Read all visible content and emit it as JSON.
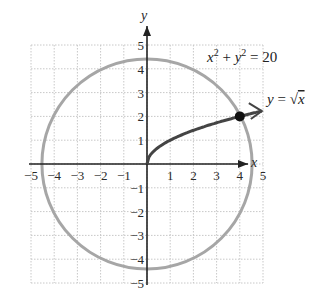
{
  "chart_data": {
    "type": "line",
    "title": "",
    "xlabel": "x",
    "ylabel": "y",
    "xlim": [
      -5,
      5
    ],
    "ylim": [
      -5,
      5
    ],
    "grid": true,
    "x_ticks": [
      "-5",
      "-4",
      "-3",
      "-2",
      "-1",
      "1",
      "2",
      "3",
      "4",
      "5"
    ],
    "y_ticks": [
      "5",
      "4",
      "3",
      "2",
      "1",
      "-1",
      "-2",
      "-3",
      "-4",
      "-5"
    ],
    "series": [
      {
        "name": "x^2 + y^2 = 20",
        "kind": "circle",
        "center": [
          0,
          0
        ],
        "radius": 4.472,
        "color": "#a6a6a6"
      },
      {
        "name": "y = sqrt(x)",
        "kind": "curve",
        "x": [
          0,
          0.25,
          1,
          2,
          3,
          4,
          5.2
        ],
        "y": [
          0,
          0.5,
          1,
          1.414,
          1.732,
          2,
          2.28
        ],
        "color": "#444444",
        "arrow_end": true
      }
    ],
    "annotations": [
      {
        "text": "x² + y² = 20",
        "position": [
          4.0,
          4.6
        ]
      },
      {
        "text": "y = √x",
        "position": [
          5.3,
          2.5
        ]
      },
      {
        "text": "intersection point",
        "point": [
          4,
          2
        ]
      }
    ]
  },
  "labels": {
    "x_axis": "x",
    "y_axis": "y",
    "circle_eq_x": "x",
    "circle_eq_plus": " + ",
    "circle_eq_y": "y",
    "circle_eq_rhs": " = 20",
    "sup": "2",
    "sqrt_eq_y": "y",
    "sqrt_eq_eq": " = ",
    "sqrt_eq_radical": "√",
    "sqrt_eq_x": "x"
  },
  "colors": {
    "grid": "#c8c8c8",
    "axis": "#222222",
    "circle": "#a6a6a6",
    "curve": "#444444",
    "point": "#111111"
  }
}
